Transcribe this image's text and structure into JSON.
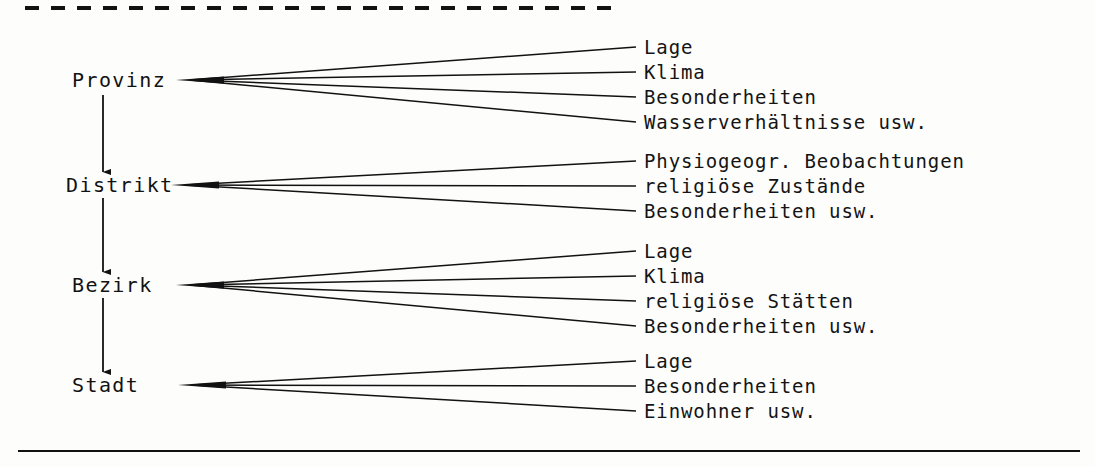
{
  "figure": {
    "kind": "hierarchy-fan-diagram",
    "language": "de",
    "ink_color": "#121212",
    "background_color": "#fdfdfc",
    "top_rule": {
      "style": "dashed",
      "x_start": 25,
      "x_end": 612,
      "y": 8,
      "thickness": 4,
      "dash": "14 12"
    },
    "bottom_rule": {
      "style": "solid",
      "x_start": 18,
      "x_end": 1080,
      "y": 451,
      "thickness": 2
    }
  },
  "levels": [
    {
      "label": "Provinz",
      "label_x": 72,
      "label_y": 80,
      "fan_origin_x": 190,
      "fan_origin_y": 80,
      "attributes": [
        {
          "text": "Lage",
          "y": 47
        },
        {
          "text": "Klima",
          "y": 72
        },
        {
          "text": "Besonderheiten",
          "y": 97
        },
        {
          "text": "Wasserverhältnisse usw.",
          "y": 122
        }
      ]
    },
    {
      "label": "Distrikt",
      "label_x": 66,
      "label_y": 185,
      "fan_origin_x": 185,
      "fan_origin_y": 185,
      "attributes": [
        {
          "text": "Physiogeogr. Beobachtungen",
          "y": 161
        },
        {
          "text": "religiöse Zustände",
          "y": 186
        },
        {
          "text": "Besonderheiten usw.",
          "y": 211
        }
      ]
    },
    {
      "label": "Bezirk",
      "label_x": 72,
      "label_y": 285,
      "fan_origin_x": 190,
      "fan_origin_y": 285,
      "attributes": [
        {
          "text": "Lage",
          "y": 251
        },
        {
          "text": "Klima",
          "y": 276
        },
        {
          "text": "religiöse Stätten",
          "y": 301
        },
        {
          "text": "Besonderheiten usw.",
          "y": 326
        }
      ]
    },
    {
      "label": "Stadt",
      "label_x": 72,
      "label_y": 385,
      "fan_origin_x": 192,
      "fan_origin_y": 385,
      "attributes": [
        {
          "text": "Lage",
          "y": 361
        },
        {
          "text": "Besonderheiten",
          "y": 386
        },
        {
          "text": "Einwohner usw.",
          "y": 411
        }
      ]
    }
  ],
  "arrows": [
    {
      "x": 103,
      "y_start": 95,
      "y_end": 172,
      "from": "Provinz",
      "to": "Distrikt"
    },
    {
      "x": 103,
      "y_start": 198,
      "y_end": 272,
      "from": "Distrikt",
      "to": "Bezirk"
    },
    {
      "x": 103,
      "y_start": 298,
      "y_end": 372,
      "from": "Bezirk",
      "to": "Stadt"
    }
  ],
  "geometry": {
    "attr_line_end_x": 636,
    "attr_text_x": 644
  }
}
